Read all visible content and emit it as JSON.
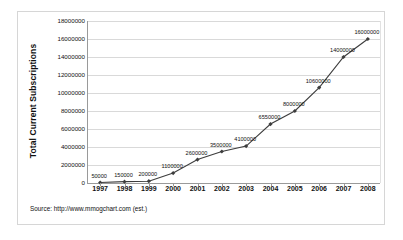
{
  "figure": {
    "source_note": "Source: http://www.mmogchart.com (est.)",
    "frame_color": "#d6d6d6",
    "background_color": "#ffffff"
  },
  "chart_data": {
    "type": "line",
    "title": "",
    "xlabel": "",
    "ylabel": "Total Current Subscriptions",
    "categories": [
      "1997",
      "1998",
      "1999",
      "2000",
      "2001",
      "2002",
      "2003",
      "2004",
      "2005",
      "2006",
      "2007",
      "2008"
    ],
    "values": [
      50000,
      150000,
      200000,
      1100000,
      2600000,
      3500000,
      4100000,
      6550000,
      8000000,
      10600000,
      14000000,
      16000000
    ],
    "point_labels": [
      "50000",
      "150000",
      "200000",
      "1100000",
      "2600000",
      "3500000",
      "4100000",
      "6550000",
      "8000000",
      "10600000",
      "14000000",
      "16000000"
    ],
    "ylim": [
      0,
      18000000
    ],
    "ytick_values": [
      0,
      2000000,
      4000000,
      6000000,
      8000000,
      10000000,
      12000000,
      14000000,
      16000000,
      18000000
    ],
    "ytick_labels": [
      "0",
      "2000000",
      "4000000",
      "6000000",
      "8000000",
      "10000000",
      "12000000",
      "14000000",
      "16000000",
      "18000000"
    ],
    "grid": true,
    "legend": false,
    "series_color": "#3d3d3d",
    "grid_color": "#d9d9d9",
    "marker": "diamond"
  }
}
